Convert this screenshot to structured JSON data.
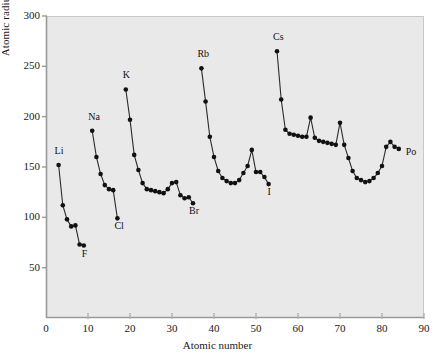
{
  "chart_data": {
    "type": "scatter",
    "title": "",
    "xlabel": "Atomic number",
    "ylabel": "Atomic radius (pm)",
    "xlim": [
      0,
      90
    ],
    "ylim": [
      0,
      300
    ],
    "xticks": [
      0,
      10,
      20,
      30,
      40,
      50,
      60,
      70,
      80,
      90
    ],
    "yticks": [
      0,
      50,
      100,
      150,
      200,
      250,
      300
    ],
    "grid": false,
    "legend": null,
    "marker": "filled-circle",
    "line": "connected-within-period",
    "series": [
      {
        "name": "period-2",
        "x": [
          3,
          4,
          5,
          6,
          7,
          8,
          9
        ],
        "values": [
          152,
          112,
          98,
          91,
          92,
          73,
          72
        ]
      },
      {
        "name": "period-3",
        "x": [
          11,
          12,
          13,
          14,
          15,
          16,
          17
        ],
        "values": [
          186,
          160,
          143,
          132,
          128,
          127,
          99
        ]
      },
      {
        "name": "period-4",
        "x": [
          19,
          20,
          21,
          22,
          23,
          24,
          25,
          26,
          27,
          28,
          29,
          30,
          31,
          32,
          33,
          34,
          35
        ],
        "values": [
          227,
          197,
          162,
          147,
          134,
          128,
          127,
          126,
          125,
          124,
          128,
          134,
          135,
          122,
          119,
          120,
          114
        ]
      },
      {
        "name": "period-5",
        "x": [
          37,
          38,
          39,
          40,
          41,
          42,
          43,
          44,
          45,
          46,
          47,
          48,
          49,
          50,
          51,
          52,
          53
        ],
        "values": [
          248,
          215,
          180,
          160,
          146,
          139,
          136,
          134,
          134,
          137,
          144,
          151,
          167,
          145,
          145,
          140,
          133
        ]
      },
      {
        "name": "period-6",
        "x": [
          55,
          56,
          57,
          58,
          59,
          60,
          61,
          62,
          63,
          64,
          65,
          66,
          67,
          68,
          69,
          70,
          71,
          72,
          73,
          74,
          75,
          76,
          77,
          78,
          79,
          80,
          81,
          82,
          83,
          84
        ],
        "values": [
          265,
          217,
          187,
          183,
          182,
          181,
          180,
          180,
          199,
          179,
          176,
          175,
          174,
          173,
          172,
          194,
          172,
          159,
          146,
          139,
          137,
          135,
          136,
          139,
          144,
          151,
          170,
          175,
          170,
          168
        ]
      }
    ],
    "annotations": [
      {
        "label": "Li",
        "x": 3,
        "y": 152,
        "dx": -4,
        "dy": -13
      },
      {
        "label": "F",
        "x": 9,
        "y": 72,
        "dx": -2,
        "dy": 9
      },
      {
        "label": "Na",
        "x": 11,
        "y": 186,
        "dx": -4,
        "dy": -13
      },
      {
        "label": "Cl",
        "x": 17,
        "y": 99,
        "dx": -3,
        "dy": 9
      },
      {
        "label": "K",
        "x": 19,
        "y": 227,
        "dx": -3,
        "dy": -13
      },
      {
        "label": "Br",
        "x": 35,
        "y": 114,
        "dx": -4,
        "dy": 9
      },
      {
        "label": "Rb",
        "x": 37,
        "y": 248,
        "dx": -4,
        "dy": -13
      },
      {
        "label": "I",
        "x": 53,
        "y": 133,
        "dx": -1,
        "dy": 9
      },
      {
        "label": "Cs",
        "x": 55,
        "y": 265,
        "dx": -4,
        "dy": -13
      },
      {
        "label": "Po",
        "x": 84,
        "y": 168,
        "dx": 7,
        "dy": 4
      }
    ],
    "style": {
      "plot_background": "#e9e9e9",
      "page_background": "#ffffff",
      "marker_color": "#111111",
      "line_color": "#2b2b2b",
      "axis_color": "#9a9a9a",
      "text_color": "#1a1a1a"
    }
  }
}
